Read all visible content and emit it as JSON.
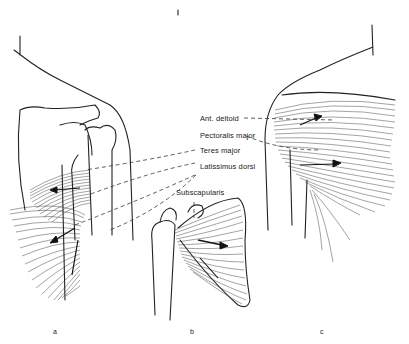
{
  "figure": {
    "labels": [
      {
        "id": "ant-deltoid",
        "text": "Ant. deltoid"
      },
      {
        "id": "pectoralis-major",
        "text": "Pectoralis major"
      },
      {
        "id": "teres-major",
        "text": "Teres major"
      },
      {
        "id": "latissimus-dorsi",
        "text": "Latissimus dorsi"
      },
      {
        "id": "subscapularis",
        "text": "Subscapularis"
      }
    ],
    "panels": [
      {
        "id": "a",
        "text": "a"
      },
      {
        "id": "b",
        "text": "b"
      },
      {
        "id": "c",
        "text": "c"
      }
    ],
    "colors": {
      "ink": "#222222",
      "background": "#ffffff"
    }
  }
}
